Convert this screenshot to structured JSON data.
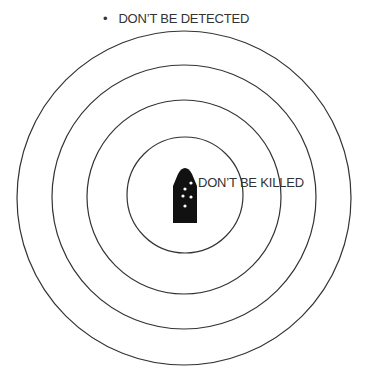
{
  "diagram": {
    "type": "concentric-rings",
    "title_bullet": "•",
    "outer_label": "DON’T BE DETECTED",
    "inner_label": "DON’T BE KILLED",
    "rings": [
      {
        "cx": 184,
        "cy": 198,
        "r": 167
      },
      {
        "cx": 184,
        "cy": 197,
        "r": 132
      },
      {
        "cx": 184,
        "cy": 197,
        "r": 97
      },
      {
        "cx": 185,
        "cy": 195,
        "r": 58
      }
    ],
    "target_icon": "damaged-vehicle-icon",
    "colors": {
      "stroke": "#333333",
      "icon_fill": "#111111",
      "background": "#ffffff"
    }
  }
}
